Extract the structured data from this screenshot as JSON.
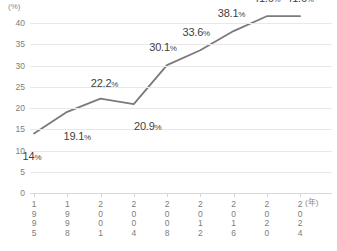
{
  "chart_data": {
    "type": "line",
    "title": "",
    "xlabel": "(年)",
    "ylabel": "(%)",
    "y_unit_caption": "(%)",
    "x_unit_caption": "(年)",
    "categories": [
      "1995",
      "1998",
      "2001",
      "2004",
      "2008",
      "2012",
      "2016",
      "2020",
      "2024"
    ],
    "values": [
      14,
      19.1,
      22.2,
      20.9,
      30.1,
      33.6,
      38.1,
      41.6,
      41.6
    ],
    "point_labels": [
      "14%",
      "19.1%",
      "22.2%",
      "20.9%",
      "30.1%",
      "33.6%",
      "38.1%",
      "41.6%",
      "41.6%"
    ],
    "ylim": [
      0,
      40
    ],
    "yticks": [
      "0",
      "5",
      "10",
      "15",
      "20",
      "25",
      "30",
      "35",
      "40"
    ],
    "ytick_values": [
      0,
      5,
      10,
      15,
      20,
      25,
      30,
      35,
      40
    ],
    "grid": true,
    "legend": "none",
    "series_color": "#7a7a7a",
    "grid_color": "#e8e8e8",
    "text_color": "#3f3f3f",
    "tick_text_color": "#7d7d7d"
  }
}
